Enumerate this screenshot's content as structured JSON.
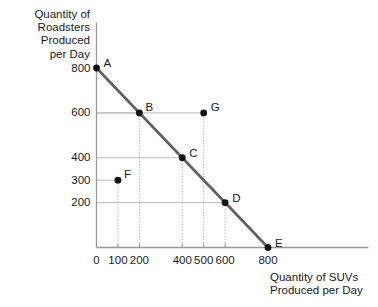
{
  "chart_data": {
    "type": "line",
    "title": "",
    "subtitle": "",
    "xlabel": "Quantity of SUVs\nProduced per Day",
    "ylabel": "Quantity of\nRoadsters\nProduced\nper Day",
    "xlim": [
      0,
      900
    ],
    "ylim": [
      0,
      860
    ],
    "grid": true,
    "legend_position": "none",
    "xticks": [
      {
        "value": 0,
        "label": "0"
      },
      {
        "value": 100,
        "label": "100"
      },
      {
        "value": 200,
        "label": "200"
      },
      {
        "value": 400,
        "label": "400"
      },
      {
        "value": 500,
        "label": "500"
      },
      {
        "value": 600,
        "label": "600"
      },
      {
        "value": 800,
        "label": "800"
      }
    ],
    "yticks": [
      {
        "value": 200,
        "label": "200"
      },
      {
        "value": 300,
        "label": "300"
      },
      {
        "value": 400,
        "label": "400"
      },
      {
        "value": 600,
        "label": "600"
      },
      {
        "value": 800,
        "label": "800"
      }
    ],
    "series": [
      {
        "name": "Production Possibilities Frontier",
        "type": "line",
        "color": "#5f5f5f",
        "x": [
          0,
          800
        ],
        "y": [
          800,
          0
        ]
      }
    ],
    "points": [
      {
        "label": "A",
        "x": 0,
        "y": 800,
        "on_frontier": true,
        "label_dx": 7,
        "label_dy": -11
      },
      {
        "label": "B",
        "x": 200,
        "y": 600,
        "on_frontier": true,
        "label_dx": 6,
        "label_dy": -12
      },
      {
        "label": "C",
        "x": 400,
        "y": 400,
        "on_frontier": true,
        "label_dx": 7,
        "label_dy": -11
      },
      {
        "label": "D",
        "x": 600,
        "y": 200,
        "on_frontier": true,
        "label_dx": 7,
        "label_dy": -11
      },
      {
        "label": "E",
        "x": 800,
        "y": 0,
        "on_frontier": true,
        "label_dx": 7,
        "label_dy": -11
      },
      {
        "label": "F",
        "x": 100,
        "y": 300,
        "on_frontier": false,
        "label_dx": 6,
        "label_dy": -12
      },
      {
        "label": "G",
        "x": 500,
        "y": 600,
        "on_frontier": false,
        "label_dx": 7,
        "label_dy": -12
      }
    ],
    "point_color": "#111111",
    "gridline_color": "#b9b9b9",
    "axis_color": "#9a9a9a"
  }
}
